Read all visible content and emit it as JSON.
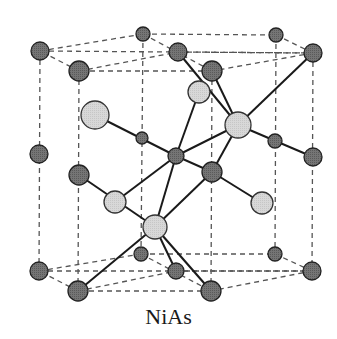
{
  "figure": {
    "caption": "NiAs",
    "legend_implicit": {
      "dark_atoms": {
        "element": "Ni",
        "color": "#6e6e6e"
      },
      "light_atoms": {
        "element": "As",
        "color": "#d4d4d4"
      }
    }
  },
  "colors": {
    "ni_fill": "#6e6e6e",
    "as_fill": "#d4d4d4",
    "outline": "#222222",
    "dashed_cell": "#555555"
  }
}
